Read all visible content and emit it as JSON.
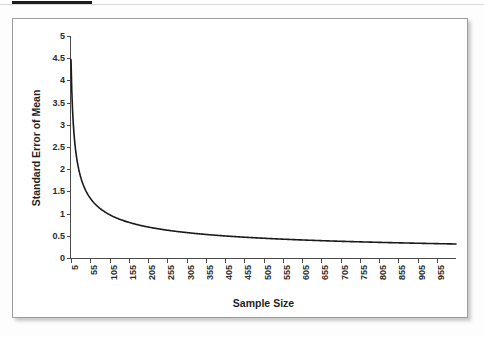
{
  "figure": {
    "top_marker": "redaction-bar",
    "frame_border_color": "#9c9c9c",
    "background_color": "#ffffff"
  },
  "chart_data": {
    "type": "line",
    "title": "",
    "subtitle": "",
    "xlabel": "Sample Size",
    "ylabel": "Standard Error of Mean",
    "grid": false,
    "legend": null,
    "line_color": "#1a1a1a",
    "xlim": [
      5,
      1005
    ],
    "ylim": [
      0,
      5
    ],
    "ytick_labels": [
      "5",
      "4.5",
      "4",
      "3.5",
      "3",
      "2.5",
      "2",
      "1.5",
      "1",
      "0.5",
      "0"
    ],
    "ytick_values": [
      5,
      4.5,
      4,
      3.5,
      3,
      2.5,
      2,
      1.5,
      1,
      0.5,
      0
    ],
    "xtick_labels": [
      "5",
      "55",
      "105",
      "155",
      "205",
      "255",
      "305",
      "355",
      "405",
      "455",
      "505",
      "555",
      "605",
      "655",
      "705",
      "755",
      "805",
      "855",
      "905",
      "955"
    ],
    "xtick_values": [
      5,
      55,
      105,
      155,
      205,
      255,
      305,
      355,
      405,
      455,
      505,
      555,
      605,
      655,
      705,
      755,
      805,
      855,
      905,
      955
    ],
    "formula": "SEM = 10 / sqrt(n)",
    "x": [
      5,
      15,
      25,
      35,
      45,
      55,
      65,
      75,
      85,
      95,
      105,
      125,
      145,
      155,
      175,
      195,
      205,
      225,
      255,
      285,
      305,
      345,
      355,
      405,
      455,
      505,
      555,
      605,
      655,
      705,
      755,
      805,
      855,
      905,
      955,
      1005
    ],
    "y": [
      4.47,
      2.58,
      2.0,
      1.69,
      1.49,
      1.35,
      1.24,
      1.15,
      1.08,
      1.03,
      0.98,
      0.89,
      0.83,
      0.8,
      0.76,
      0.72,
      0.7,
      0.67,
      0.63,
      0.59,
      0.57,
      0.54,
      0.53,
      0.5,
      0.47,
      0.45,
      0.42,
      0.41,
      0.39,
      0.38,
      0.36,
      0.35,
      0.34,
      0.33,
      0.32,
      0.32
    ],
    "series": [
      {
        "name": "Standard Error of Mean",
        "values": [
          4.47,
          2.58,
          2.0,
          1.69,
          1.49,
          1.35,
          1.24,
          1.15,
          1.08,
          1.03,
          0.98,
          0.89,
          0.83,
          0.8,
          0.76,
          0.72,
          0.7,
          0.67,
          0.63,
          0.59,
          0.57,
          0.54,
          0.53,
          0.5,
          0.47,
          0.45,
          0.42,
          0.41,
          0.39,
          0.38,
          0.36,
          0.35,
          0.34,
          0.33,
          0.32,
          0.32
        ]
      }
    ]
  }
}
